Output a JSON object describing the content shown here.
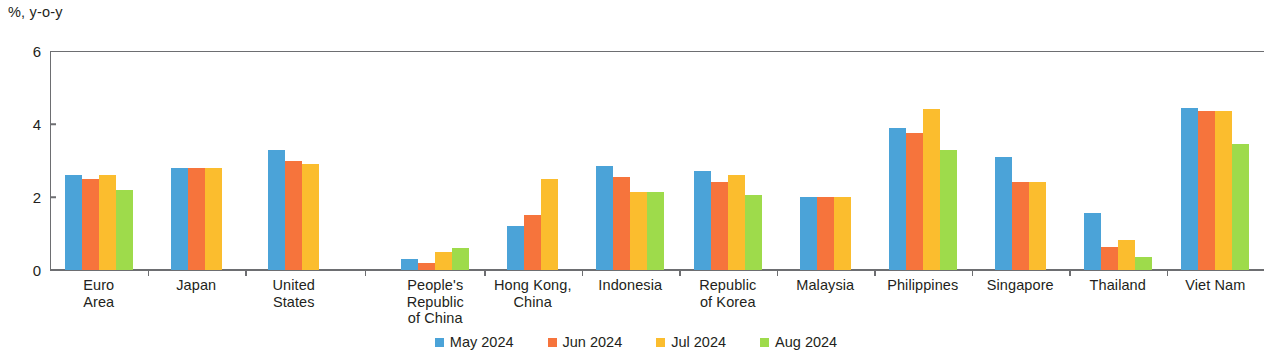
{
  "chart_data": {
    "type": "bar",
    "title": "",
    "subtitle": "",
    "xlabel": "",
    "ylabel": "%, y-o-y",
    "ylim": [
      0,
      6
    ],
    "yticks": [
      0,
      2,
      4,
      6
    ],
    "grid": false,
    "legend_position": "bottom-center",
    "categories": [
      "Euro Area",
      "Japan",
      "United States",
      "People's Republic of China",
      "Hong Kong, China",
      "Indonesia",
      "Republic of Korea",
      "Malaysia",
      "Philippines",
      "Singapore",
      "Thailand",
      "Viet Nam"
    ],
    "category_label_lines": [
      [
        "Euro",
        "Area"
      ],
      [
        "Japan"
      ],
      [
        "United",
        "States"
      ],
      [
        "People's",
        "Republic",
        "of China"
      ],
      [
        "Hong Kong,",
        "China"
      ],
      [
        "Indonesia"
      ],
      [
        "Republic",
        "of Korea"
      ],
      [
        "Malaysia"
      ],
      [
        "Philippines"
      ],
      [
        "Singapore"
      ],
      [
        "Thailand"
      ],
      [
        "Viet Nam"
      ]
    ],
    "series": [
      {
        "name": "May 2024",
        "color": "#4BA3D8",
        "values": [
          2.6,
          2.8,
          3.3,
          0.3,
          1.2,
          2.85,
          2.7,
          2.0,
          3.9,
          3.1,
          1.55,
          4.45
        ]
      },
      {
        "name": "Jun 2024",
        "color": "#F6743C",
        "values": [
          2.5,
          2.8,
          3.0,
          0.2,
          1.5,
          2.55,
          2.4,
          2.0,
          3.75,
          2.4,
          0.62,
          4.35
        ]
      },
      {
        "name": "Jul 2024",
        "color": "#FBBD2E",
        "values": [
          2.6,
          2.8,
          2.9,
          0.5,
          2.5,
          2.15,
          2.6,
          2.0,
          4.4,
          2.4,
          0.83,
          4.37
        ]
      },
      {
        "name": "Aug 2024",
        "color": "#9EDB4B",
        "values": [
          2.2,
          null,
          null,
          0.6,
          null,
          2.15,
          2.05,
          null,
          3.3,
          null,
          0.35,
          3.45
        ]
      }
    ]
  },
  "axis": {
    "y_title": "%, y-o-y"
  },
  "colors": {
    "axis": "#6d6e71",
    "text": "#231f20",
    "may": "#4BA3D8",
    "jun": "#F6743C",
    "jul": "#FBBD2E",
    "aug": "#9EDB4B"
  }
}
